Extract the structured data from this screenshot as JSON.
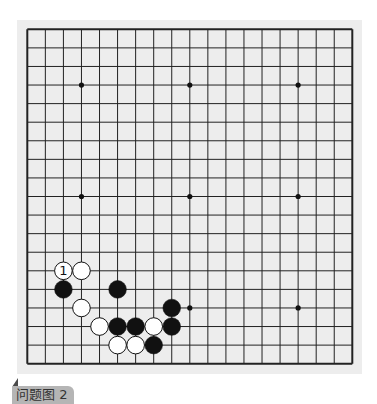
{
  "caption": {
    "label": "问题图 2"
  },
  "board": {
    "size": 19,
    "colors": {
      "background": "#ededed",
      "line": "#222222",
      "black": "#111111",
      "white": "#ffffff"
    },
    "star_points": [
      [
        3,
        3
      ],
      [
        9,
        3
      ],
      [
        15,
        3
      ],
      [
        3,
        9
      ],
      [
        9,
        9
      ],
      [
        15,
        9
      ],
      [
        3,
        15
      ],
      [
        9,
        15
      ],
      [
        15,
        15
      ]
    ],
    "stones": [
      {
        "col": 2,
        "row": 13,
        "color": "white",
        "label": "1"
      },
      {
        "col": 3,
        "row": 13,
        "color": "white"
      },
      {
        "col": 2,
        "row": 14,
        "color": "black"
      },
      {
        "col": 5,
        "row": 14,
        "color": "black"
      },
      {
        "col": 3,
        "row": 15,
        "color": "white"
      },
      {
        "col": 8,
        "row": 15,
        "color": "black"
      },
      {
        "col": 4,
        "row": 16,
        "color": "white"
      },
      {
        "col": 5,
        "row": 16,
        "color": "black"
      },
      {
        "col": 6,
        "row": 16,
        "color": "black"
      },
      {
        "col": 7,
        "row": 16,
        "color": "white"
      },
      {
        "col": 8,
        "row": 16,
        "color": "black"
      },
      {
        "col": 5,
        "row": 17,
        "color": "white"
      },
      {
        "col": 6,
        "row": 17,
        "color": "white"
      },
      {
        "col": 7,
        "row": 17,
        "color": "black"
      }
    ]
  }
}
